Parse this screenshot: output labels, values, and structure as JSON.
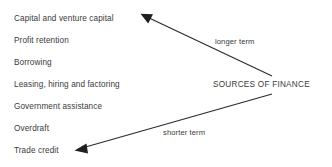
{
  "diagram": {
    "title": "Sources of Finance",
    "background_color": "#ffffff",
    "ink_color": "#3a3a3a",
    "central_label": "SOURCES OF FINANCE",
    "sources_list": [
      {
        "label": "Capital and venture capital"
      },
      {
        "label": "Profit retention"
      },
      {
        "label": "Borrowing"
      },
      {
        "label": "Leasing, hiring and factoring"
      },
      {
        "label": "Government assistance"
      },
      {
        "label": "Overdraft"
      },
      {
        "label": "Trade credit"
      }
    ],
    "arrows": [
      {
        "name": "longer-term-arrow",
        "label": "longer term",
        "points_to": "Capital and venture capital",
        "from": "SOURCES OF FINANCE",
        "direction": "up-left"
      },
      {
        "name": "shorter-term-arrow",
        "label": "shorter term",
        "points_to": "Trade credit",
        "from": "SOURCES OF FINANCE",
        "direction": "down-left"
      }
    ]
  }
}
